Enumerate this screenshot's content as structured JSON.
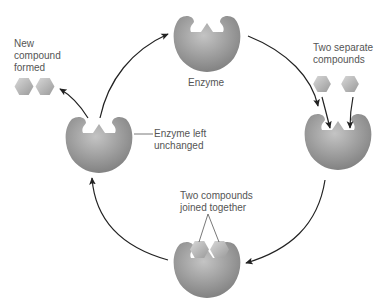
{
  "diagram": {
    "labels": {
      "enzyme": "Enzyme",
      "two_separate_line1": "Two separate",
      "two_separate_line2": "compounds",
      "joined_line1": "Two compounds",
      "joined_line2": "joined together",
      "left_unchanged_line1": "Enzyme left",
      "left_unchanged_line2": "unchanged",
      "new_compound_line1": "New",
      "new_compound_line2": "compound",
      "new_compound_line3": "formed"
    },
    "stages": [
      {
        "id": "free-enzyme",
        "position": "top"
      },
      {
        "id": "substrates-approach",
        "position": "right"
      },
      {
        "id": "substrates-bound",
        "position": "bottom"
      },
      {
        "id": "enzyme-released",
        "position": "left"
      }
    ],
    "colors": {
      "enzyme_light": "#bdbdbd",
      "enzyme_dark": "#7a7a7a",
      "hexagon_light": "#d4d4d4",
      "hexagon_dark": "#9c9c9c",
      "arrow": "#222222",
      "text": "#555555"
    }
  }
}
